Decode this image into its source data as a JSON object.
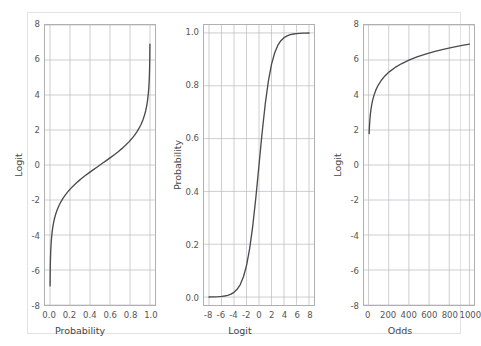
{
  "figure": {
    "background_color": "#ffffff",
    "border_color": "#e3e3e3",
    "grid_color": "#b8b8c0",
    "axis_color": "#b0b0b0",
    "curve_color": "#4a4a4a",
    "tick_label_color": "#555555",
    "axis_title_color": "#444444"
  },
  "chart_data": [
    {
      "type": "line",
      "title": "",
      "xlabel": "Probability",
      "ylabel": "Logit",
      "xlim": [
        -0.05,
        1.05
      ],
      "ylim": [
        -8,
        8
      ],
      "xticks": [
        0.0,
        0.2,
        0.4,
        0.6,
        0.8,
        1.0
      ],
      "xticklabels": [
        "0.0",
        "0.2",
        "0.4",
        "0.6",
        "0.8",
        "1.0"
      ],
      "yticks": [
        -8,
        -6,
        -4,
        -2,
        0,
        2,
        4,
        6,
        8
      ],
      "yticklabels": [
        "-8",
        "-6",
        "-4",
        "-2",
        "0",
        "2",
        "4",
        "6",
        "8"
      ],
      "grid": true,
      "legend": "none",
      "series": [
        {
          "name": "logit(p) = ln(p/(1-p))",
          "x": [
            0.001,
            0.002,
            0.004,
            0.007,
            0.011,
            0.016,
            0.023,
            0.032,
            0.043,
            0.056,
            0.071,
            0.089,
            0.109,
            0.131,
            0.156,
            0.183,
            0.213,
            0.245,
            0.279,
            0.315,
            0.353,
            0.393,
            0.434,
            0.476,
            0.5,
            0.524,
            0.566,
            0.607,
            0.647,
            0.685,
            0.721,
            0.755,
            0.787,
            0.817,
            0.844,
            0.869,
            0.891,
            0.911,
            0.929,
            0.944,
            0.957,
            0.968,
            0.977,
            0.984,
            0.989,
            0.993,
            0.996,
            0.998,
            0.999
          ],
          "y": [
            -6.907,
            -6.212,
            -5.517,
            -4.956,
            -4.5,
            -4.119,
            -3.751,
            -3.409,
            -3.1,
            -2.824,
            -2.57,
            -2.327,
            -2.102,
            -1.89,
            -1.69,
            -1.497,
            -1.308,
            -1.125,
            -0.949,
            -0.777,
            -0.605,
            -0.435,
            -0.265,
            -0.096,
            0.0,
            0.096,
            0.265,
            0.435,
            0.605,
            0.777,
            0.949,
            1.125,
            1.308,
            1.497,
            1.69,
            1.89,
            2.102,
            2.327,
            2.57,
            2.824,
            3.1,
            3.409,
            3.751,
            4.119,
            4.5,
            4.956,
            5.517,
            6.212,
            6.907
          ]
        }
      ]
    },
    {
      "type": "line",
      "title": "",
      "xlabel": "Logit",
      "ylabel": "Probability",
      "xlim": [
        -8.8,
        8.8
      ],
      "ylim": [
        -0.03,
        1.03
      ],
      "xticks": [
        -8,
        -6,
        -4,
        -2,
        0,
        2,
        4,
        6,
        8
      ],
      "xticklabels": [
        "-8",
        "-6",
        "-4",
        "-2",
        "0",
        "2",
        "4",
        "6",
        "8"
      ],
      "yticks": [
        0.0,
        0.2,
        0.4,
        0.6,
        0.8,
        1.0
      ],
      "yticklabels": [
        "0.0",
        "0.2",
        "0.4",
        "0.6",
        "0.8",
        "1.0"
      ],
      "grid": true,
      "legend": "none",
      "series": [
        {
          "name": "p = 1/(1+exp(-z))",
          "x": [
            -8.0,
            -7.5,
            -7.0,
            -6.5,
            -6.0,
            -5.5,
            -5.0,
            -4.5,
            -4.0,
            -3.5,
            -3.0,
            -2.5,
            -2.0,
            -1.5,
            -1.0,
            -0.5,
            0.0,
            0.5,
            1.0,
            1.5,
            2.0,
            2.5,
            3.0,
            3.5,
            4.0,
            4.5,
            5.0,
            5.5,
            6.0,
            6.5,
            7.0,
            7.5,
            8.0
          ],
          "y": [
            0.000335,
            0.000553,
            0.000911,
            0.001503,
            0.002473,
            0.00407,
            0.006693,
            0.011109,
            0.017986,
            0.029312,
            0.047426,
            0.075858,
            0.119203,
            0.182426,
            0.268941,
            0.377541,
            0.5,
            0.622459,
            0.731059,
            0.817574,
            0.880797,
            0.924142,
            0.952574,
            0.970688,
            0.982014,
            0.988891,
            0.993307,
            0.99593,
            0.997527,
            0.998497,
            0.999089,
            0.999447,
            0.999665
          ]
        }
      ]
    },
    {
      "type": "line",
      "title": "",
      "xlabel": "Odds",
      "ylabel": "Logit",
      "xlim": [
        -45,
        1045
      ],
      "ylim": [
        -8,
        8
      ],
      "xticks": [
        0,
        200,
        400,
        600,
        800,
        1000
      ],
      "xticklabels": [
        "0",
        "200",
        "400",
        "600",
        "800",
        "1000"
      ],
      "yticks": [
        -8,
        -6,
        -4,
        -2,
        0,
        2,
        4,
        6,
        8
      ],
      "yticklabels": [
        "-8",
        "-6",
        "-4",
        "-2",
        "0",
        "2",
        "4",
        "6",
        "8"
      ],
      "grid": true,
      "legend": "none",
      "series": [
        {
          "name": "logit = ln(odds)",
          "x": [
            6,
            8,
            10,
            14,
            18,
            24,
            32,
            42,
            55,
            72,
            95,
            125,
            160,
            205,
            260,
            325,
            400,
            480,
            565,
            650,
            740,
            830,
            915,
            1000
          ],
          "y": [
            1.792,
            2.079,
            2.303,
            2.639,
            2.89,
            3.178,
            3.466,
            3.738,
            4.007,
            4.277,
            4.554,
            4.828,
            5.075,
            5.323,
            5.561,
            5.784,
            5.991,
            6.174,
            6.337,
            6.477,
            6.607,
            6.721,
            6.819,
            6.908
          ]
        }
      ]
    }
  ]
}
